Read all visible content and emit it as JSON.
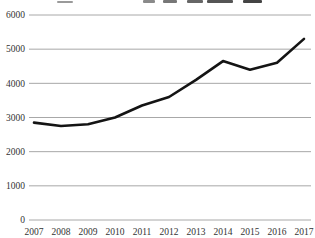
{
  "chart_data": {
    "type": "line",
    "title": "",
    "title_clipped": true,
    "categories": [
      "2007",
      "2008",
      "2009",
      "2010",
      "2011",
      "2012",
      "2013",
      "2014",
      "2015",
      "2016",
      "2017"
    ],
    "values": [
      2850,
      2750,
      2800,
      3000,
      3350,
      3600,
      4100,
      4650,
      4400,
      4600,
      5300
    ],
    "xlabel": "",
    "ylabel": "",
    "ylim": [
      0,
      6000
    ],
    "yticks": [
      "0",
      "1000",
      "2000",
      "3000",
      "4000",
      "5000",
      "6000"
    ],
    "grid": true,
    "legend": "none",
    "line_color": "#141414",
    "grid_color": "#a8a8a8",
    "label_color": "#333333",
    "background_color": "#ffffff"
  }
}
